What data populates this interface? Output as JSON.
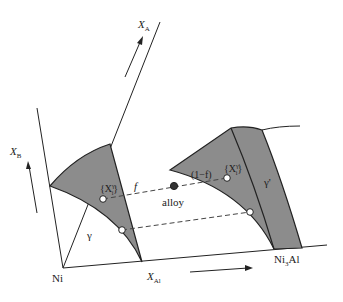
{
  "diagram": {
    "type": "schematic ternary phase diagram (gamma / gamma-prime two-phase equilibrium, lever rule)",
    "colors": {
      "line": "#222222",
      "phase_fill": "#8c8c8c",
      "tie_line": "#444444",
      "alloy_point": "#333333",
      "phase_point": "#ffffff"
    },
    "axes": {
      "x_a": {
        "label": "X",
        "sub": "A"
      },
      "x_b": {
        "label": "X",
        "sub": "B"
      },
      "x_al": {
        "label": "X",
        "sub": "Al"
      }
    },
    "corners": {
      "origin": "Ni",
      "compound": {
        "base": "Ni",
        "sub": "3",
        "rest": "Al"
      }
    },
    "phases": {
      "gamma": {
        "label": "γ"
      },
      "gamma_prime": {
        "label": "γ'"
      }
    },
    "points": {
      "alloy": {
        "label": "alloy"
      },
      "gamma_composition": {
        "open": "{X",
        "sup": "γ",
        "sub": "i",
        "close": "}"
      },
      "gamma_prime_composition": {
        "open": "{X",
        "sup": "γ'",
        "sub": "i",
        "close": "}"
      }
    },
    "lever_rule": {
      "gamma_fraction": "f",
      "gamma_prime_fraction": "(1−f)"
    }
  }
}
